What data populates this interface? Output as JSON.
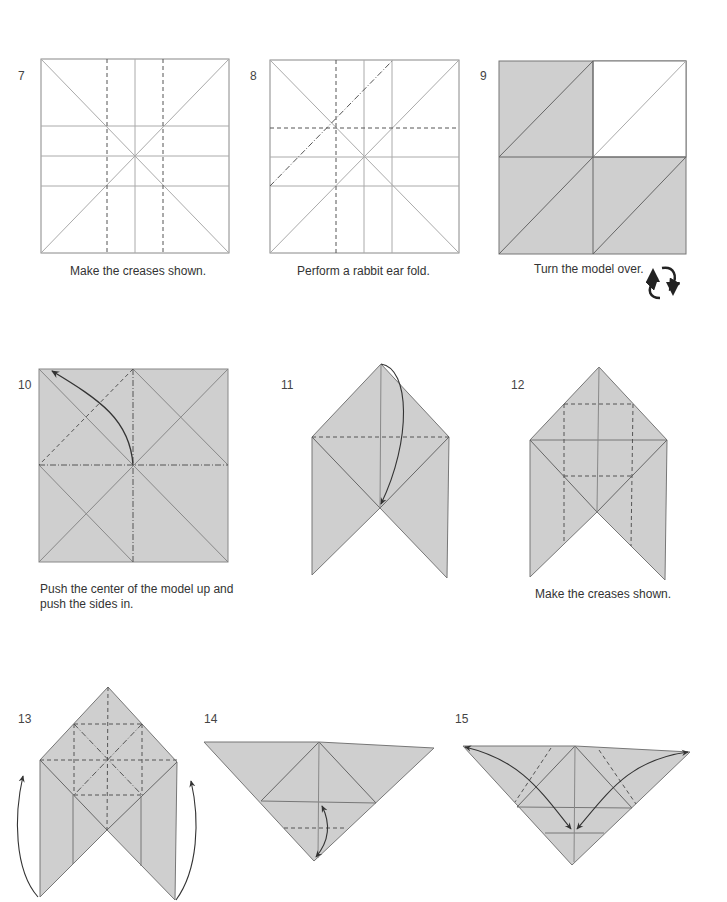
{
  "colors": {
    "paper_colored": "#cfcfcf",
    "paper_white": "#ffffff",
    "edge": "#777777",
    "crease": "#999999",
    "fold_line": "#555555",
    "arrow": "#333333"
  },
  "steps": [
    {
      "number": "7",
      "caption": "Make the creases shown."
    },
    {
      "number": "8",
      "caption": "Perform a rabbit ear fold."
    },
    {
      "number": "9",
      "caption": "Turn the model over.",
      "icon": "turn-over-icon"
    },
    {
      "number": "10",
      "caption_line1": "Push the center of the model up and",
      "caption_line2": "push the sides in."
    },
    {
      "number": "11",
      "caption": ""
    },
    {
      "number": "12",
      "caption": "Make the creases shown."
    },
    {
      "number": "13",
      "caption": ""
    },
    {
      "number": "14",
      "caption": ""
    },
    {
      "number": "15",
      "caption": ""
    }
  ]
}
